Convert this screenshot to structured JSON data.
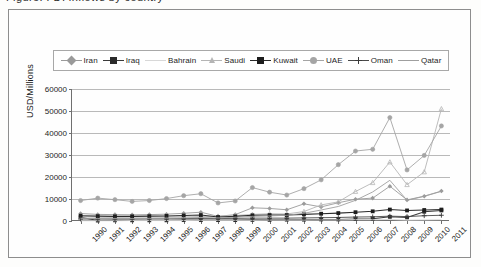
{
  "caption_sliver": "Figure: FDI inflows by country",
  "chart_data": {
    "type": "line",
    "title": "",
    "xlabel": "",
    "ylabel": "USD/Millions",
    "ylim": [
      0,
      60000
    ],
    "ytick_step": 10000,
    "yticks": [
      "0",
      "10000",
      "20000",
      "30000",
      "40000",
      "50000",
      "60000"
    ],
    "grid": true,
    "legend_position": "top",
    "categories": [
      "1990",
      "1991",
      "1992",
      "1993",
      "1994",
      "1995",
      "1996",
      "1997",
      "1998",
      "1999",
      "2000",
      "2001",
      "2002",
      "2003",
      "2004",
      "2005",
      "2006",
      "2007",
      "2008",
      "2009",
      "2010",
      "2011"
    ],
    "series": [
      {
        "name": "Iran",
        "color": "#9a9a9a",
        "marker": "diamond",
        "marker_fill": "#9a9a9a",
        "values": [
          3400,
          3000,
          2900,
          2800,
          2900,
          3100,
          3500,
          4000,
          2100,
          2900,
          6000,
          5700,
          5100,
          7800,
          6400,
          8300,
          9900,
          10400,
          15800,
          9600,
          11300,
          13600
        ]
      },
      {
        "name": "Iraq",
        "color": "#3a3a3a",
        "marker": "square",
        "marker_fill": "#2b2b2b",
        "values": [
          1700,
          200,
          300,
          300,
          300,
          300,
          400,
          400,
          400,
          400,
          500,
          500,
          600,
          600,
          700,
          700,
          900,
          1000,
          1900,
          1600,
          4200,
          4800
        ]
      },
      {
        "name": "Bahrain",
        "color": "#d8d8d8",
        "marker": "none",
        "marker_fill": "#d8d8d8",
        "values": [
          100,
          100,
          100,
          200,
          200,
          200,
          200,
          300,
          300,
          300,
          300,
          400,
          400,
          400,
          500,
          500,
          600,
          600,
          700,
          400,
          500,
          600
        ]
      },
      {
        "name": "Saudi",
        "color": "#b5b5b5",
        "marker": "triangle",
        "marker_fill": "#b5b5b5",
        "values": [
          1900,
          1700,
          1600,
          1700,
          1800,
          1800,
          1900,
          2000,
          2200,
          2500,
          3000,
          3300,
          3200,
          4300,
          7300,
          8700,
          13400,
          17400,
          26800,
          16500,
          22300,
          51000
        ]
      },
      {
        "name": "Kuwait",
        "color": "#2b2b2b",
        "marker": "square",
        "marker_fill": "#1d1d1d",
        "values": [
          2400,
          2200,
          2100,
          2100,
          2200,
          2300,
          2500,
          2700,
          1800,
          2100,
          2600,
          2700,
          2700,
          3000,
          3300,
          3600,
          4000,
          4400,
          5200,
          4800,
          5000,
          5200
        ]
      },
      {
        "name": "UAE",
        "color": "#a5a5a5",
        "marker": "circle",
        "marker_fill": "#a5a5a5",
        "values": [
          9300,
          10400,
          9700,
          8900,
          9300,
          10200,
          11500,
          12400,
          8200,
          9100,
          15200,
          13100,
          11800,
          14700,
          18700,
          25600,
          31800,
          32600,
          47000,
          23200,
          29800,
          43200
        ]
      },
      {
        "name": "Oman",
        "color": "#4a4a4a",
        "marker": "plus",
        "marker_fill": "#3a3a3a",
        "values": [
          900,
          900,
          900,
          900,
          1000,
          1000,
          1100,
          1200,
          1100,
          1200,
          1300,
          1300,
          1300,
          1400,
          1500,
          1600,
          1800,
          1900,
          2200,
          2000,
          2400,
          2600
        ]
      },
      {
        "name": "Qatar",
        "color": "#9f9f9f",
        "marker": "none",
        "marker_fill": "#9f9f9f",
        "values": [
          1200,
          1100,
          1100,
          1100,
          1200,
          1300,
          1400,
          1600,
          1400,
          1700,
          2100,
          2300,
          2600,
          3500,
          5000,
          6600,
          9400,
          13200,
          18500,
          9400,
          11200,
          13500
        ]
      }
    ]
  }
}
